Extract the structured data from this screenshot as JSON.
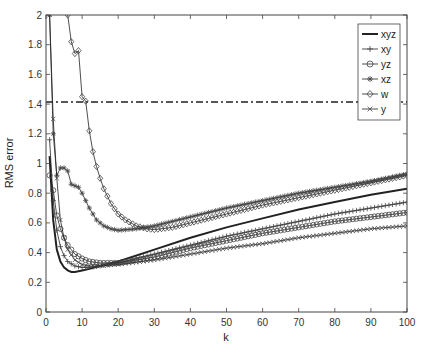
{
  "chart_data": {
    "type": "line",
    "title": "",
    "xlabel": "k",
    "ylabel": "RMS error",
    "xlim": [
      0,
      100
    ],
    "ylim": [
      0,
      2
    ],
    "xticks": [
      0,
      10,
      20,
      30,
      40,
      50,
      60,
      70,
      80,
      90,
      100
    ],
    "yticks": [
      0,
      0.2,
      0.4,
      0.6,
      0.8,
      1,
      1.2,
      1.4,
      1.6,
      1.8,
      2
    ],
    "xtick_labels": [
      "0",
      "10",
      "20",
      "30",
      "40",
      "50",
      "60",
      "70",
      "80",
      "90",
      "100"
    ],
    "ytick_labels": [
      "0",
      "0.2",
      "0.4",
      "0.6",
      "0.8",
      "1",
      "1.2",
      "1.4",
      "1.6",
      "1.8",
      "2"
    ],
    "grid": false,
    "legend_position": "upper right",
    "reference_line": {
      "y": 1.414,
      "style": "dash-dot"
    },
    "series": [
      {
        "name": "xyz",
        "marker": "none",
        "style": "thick-solid",
        "x": [
          1,
          2,
          3,
          4,
          5,
          6,
          7,
          8,
          10,
          12,
          15,
          20,
          30,
          40,
          50,
          60,
          70,
          80,
          90,
          100
        ],
        "y": [
          1.05,
          0.62,
          0.42,
          0.34,
          0.3,
          0.28,
          0.27,
          0.27,
          0.28,
          0.29,
          0.31,
          0.34,
          0.42,
          0.5,
          0.57,
          0.63,
          0.69,
          0.74,
          0.79,
          0.83
        ]
      },
      {
        "name": "xy",
        "marker": "plus",
        "style": "thin-solid",
        "x": [
          1,
          2,
          3,
          4,
          5,
          6,
          8,
          10,
          12,
          15,
          20,
          30,
          40,
          50,
          60,
          70,
          80,
          90,
          100
        ],
        "y": [
          1.16,
          0.75,
          0.55,
          0.44,
          0.38,
          0.34,
          0.31,
          0.3,
          0.3,
          0.31,
          0.33,
          0.39,
          0.45,
          0.51,
          0.56,
          0.61,
          0.66,
          0.7,
          0.74
        ]
      },
      {
        "name": "yz",
        "marker": "circle",
        "style": "thin-solid",
        "x": [
          1,
          2,
          3,
          4,
          5,
          6,
          8,
          10,
          12,
          15,
          20,
          30,
          40,
          50,
          60,
          70,
          80,
          90,
          100
        ],
        "y": [
          0.92,
          0.82,
          0.65,
          0.56,
          0.5,
          0.45,
          0.39,
          0.36,
          0.34,
          0.33,
          0.33,
          0.37,
          0.43,
          0.48,
          0.53,
          0.57,
          0.61,
          0.64,
          0.67
        ]
      },
      {
        "name": "xz",
        "marker": "asterisk",
        "style": "thin-solid",
        "x": [
          1,
          2,
          3,
          4,
          5,
          6,
          7,
          8,
          9,
          10,
          12,
          14,
          16,
          18,
          20,
          25,
          30,
          40,
          50,
          60,
          70,
          80,
          90,
          100
        ],
        "y": [
          2.0,
          1.2,
          0.92,
          0.97,
          0.97,
          0.95,
          0.86,
          0.85,
          0.84,
          0.8,
          0.7,
          0.62,
          0.58,
          0.56,
          0.55,
          0.56,
          0.58,
          0.64,
          0.7,
          0.75,
          0.8,
          0.84,
          0.88,
          0.93
        ]
      },
      {
        "name": "w",
        "marker": "diamond",
        "style": "thin-solid",
        "x": [
          6,
          7,
          8,
          9,
          10,
          11,
          12,
          13,
          14,
          15,
          16,
          18,
          20,
          22,
          25,
          28,
          30,
          35,
          40,
          50,
          60,
          70,
          80,
          90,
          100
        ],
        "y": [
          2.0,
          1.82,
          1.74,
          1.76,
          1.45,
          1.42,
          1.22,
          1.08,
          0.98,
          0.9,
          0.83,
          0.73,
          0.66,
          0.62,
          0.58,
          0.56,
          0.555,
          0.57,
          0.6,
          0.66,
          0.72,
          0.77,
          0.82,
          0.87,
          0.92
        ]
      },
      {
        "name": "y",
        "marker": "x",
        "style": "thin-solid",
        "x": [
          1,
          2,
          3,
          4,
          5,
          6,
          8,
          10,
          12,
          15,
          20,
          30,
          40,
          50,
          60,
          70,
          80,
          90,
          100
        ],
        "y": [
          2.0,
          1.3,
          0.9,
          0.62,
          0.5,
          0.42,
          0.35,
          0.32,
          0.31,
          0.31,
          0.32,
          0.35,
          0.39,
          0.43,
          0.46,
          0.5,
          0.53,
          0.56,
          0.58
        ]
      }
    ]
  },
  "legend": {
    "items": [
      {
        "label": "xyz",
        "marker": "none"
      },
      {
        "label": "xy",
        "marker": "plus"
      },
      {
        "label": "yz",
        "marker": "circle"
      },
      {
        "label": "xz",
        "marker": "asterisk"
      },
      {
        "label": "w",
        "marker": "diamond"
      },
      {
        "label": "y",
        "marker": "x"
      }
    ]
  },
  "colors": {
    "line": "#222222",
    "axis": "#444444",
    "marker": "#444444",
    "background": "#ffffff"
  }
}
